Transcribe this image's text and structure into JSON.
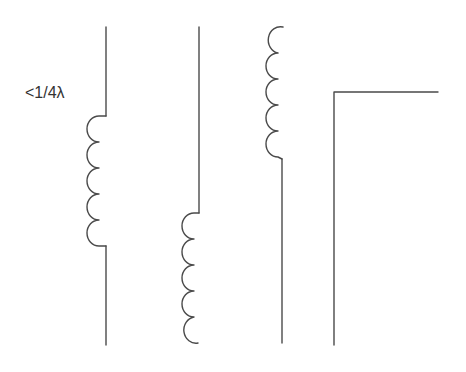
{
  "diagram": {
    "label": "<1/4λ",
    "stroke_color": "#4a4a4a",
    "text_color": "#333333",
    "antennas": [
      {
        "name": "center-loaded",
        "description": "vertical with loading coil in middle"
      },
      {
        "name": "base-loaded",
        "description": "vertical with loading coil at base"
      },
      {
        "name": "top-loaded",
        "description": "vertical with loading coil at top"
      },
      {
        "name": "inverted-l",
        "description": "inverted-L antenna"
      }
    ]
  }
}
